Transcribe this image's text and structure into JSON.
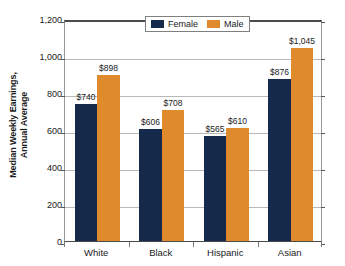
{
  "chart_data": {
    "type": "bar",
    "title": "",
    "subtitle": "",
    "xlabel": "",
    "ylabel_line1": "Median Weekly Earnings,",
    "ylabel_line2": "Annual Average",
    "categories": [
      "White",
      "Black",
      "Hispanic",
      "Asian"
    ],
    "series": [
      {
        "name": "Female",
        "color": "#15294a",
        "values": [
          740,
          606,
          565,
          876
        ],
        "labels": [
          "$740",
          "$606",
          "$565",
          "$876"
        ]
      },
      {
        "name": "Male",
        "color": "#e08a2e",
        "values": [
          898,
          708,
          610,
          1045
        ],
        "labels": [
          "$898",
          "$708",
          "$610",
          "$1,045"
        ]
      }
    ],
    "ylim": [
      0,
      1200
    ],
    "yticks": [
      0,
      200,
      400,
      600,
      800,
      1000,
      1200
    ],
    "ytick_labels": [
      "0",
      "200",
      "400",
      "600",
      "800",
      "1,000",
      "1,200"
    ],
    "grid": true,
    "legend_position": "top-center"
  },
  "legend": {
    "entries": [
      {
        "label": "Female",
        "swatch": "female-swatch"
      },
      {
        "label": "Male",
        "swatch": "male-swatch"
      }
    ]
  }
}
